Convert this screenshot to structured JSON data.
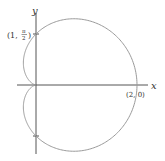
{
  "diagram": {
    "type": "polar-curve",
    "curve": "cardioid r = 1 + cos θ",
    "axes": {
      "x_label": "x",
      "y_label": "y"
    },
    "points": [
      {
        "label": "(2, 0)",
        "x": 2,
        "y": 0
      },
      {
        "label_prefix": "(1,",
        "label_num": "π",
        "label_den": "2",
        "label_suffix": ")",
        "r": 1,
        "theta": "π/2"
      }
    ],
    "colors": {
      "curve": "#9a9a9a",
      "axes": "#444444"
    }
  }
}
